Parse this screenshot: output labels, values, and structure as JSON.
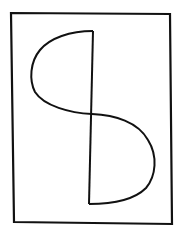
{
  "sketch": {
    "description": "Hand-drawn rectangular frame containing a vertical line with two half-lobes forming an S-like shape",
    "stroke_color": "#111111",
    "background_color": "#ffffff",
    "frame": {
      "points": [
        [
          11,
          13
        ],
        [
          170,
          14
        ],
        [
          172,
          224
        ],
        [
          14,
          222
        ]
      ]
    },
    "vertical_line": {
      "from": [
        93,
        31
      ],
      "to": [
        89,
        204
      ]
    },
    "upper_lobe": {
      "start": [
        93,
        31
      ],
      "extreme": [
        31,
        70
      ],
      "end": [
        92,
        114
      ],
      "side": "left"
    },
    "lower_lobe": {
      "start": [
        92,
        114
      ],
      "extreme": [
        155,
        165
      ],
      "end": [
        89,
        204
      ],
      "side": "right"
    }
  }
}
